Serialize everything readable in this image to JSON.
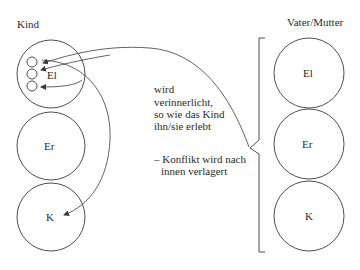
{
  "left_group": {
    "title": "Kind",
    "circles": [
      {
        "label": "El"
      },
      {
        "label": "Er"
      },
      {
        "label": "K"
      }
    ]
  },
  "right_group": {
    "title": "Vater/Mutter",
    "circles": [
      {
        "label": "El"
      },
      {
        "label": "Er"
      },
      {
        "label": "K"
      }
    ]
  },
  "annotation": {
    "lines": [
      "wird",
      "verinnerlicht,",
      "so wie das Kind",
      "ihn/sie erlebt"
    ],
    "note_lines": [
      "– Konflikt wird nach",
      "innen verlagert"
    ]
  },
  "colors": {
    "stroke": "#3a3a3a",
    "text": "#2a2a2a",
    "background": "#ffffff"
  }
}
